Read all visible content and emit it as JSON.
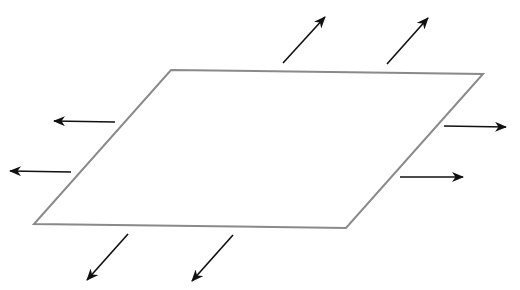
{
  "diagram": {
    "title": "",
    "colors": {
      "background": "#ffffff",
      "sheet_outline": "#8a8a8a",
      "arrow": "#111111"
    },
    "sheet": {
      "points": "171,70 483,74 346,228 34,224"
    },
    "arrows": [
      {
        "name": "arrow-top-1",
        "x1": 283,
        "y1": 63,
        "x2": 325,
        "y2": 17,
        "direction": "up-right"
      },
      {
        "name": "arrow-top-2",
        "x1": 387,
        "y1": 64,
        "x2": 428,
        "y2": 18,
        "direction": "up-right"
      },
      {
        "name": "arrow-left-1",
        "x1": 115,
        "y1": 122,
        "x2": 54,
        "y2": 121,
        "direction": "left"
      },
      {
        "name": "arrow-left-2",
        "x1": 71,
        "y1": 172,
        "x2": 10,
        "y2": 171,
        "direction": "left"
      },
      {
        "name": "arrow-right-1",
        "x1": 444,
        "y1": 126,
        "x2": 506,
        "y2": 127,
        "direction": "right"
      },
      {
        "name": "arrow-right-2",
        "x1": 400,
        "y1": 177,
        "x2": 463,
        "y2": 177,
        "direction": "right"
      },
      {
        "name": "arrow-bottom-1",
        "x1": 128,
        "y1": 234,
        "x2": 87,
        "y2": 280,
        "direction": "down-left"
      },
      {
        "name": "arrow-bottom-2",
        "x1": 233,
        "y1": 235,
        "x2": 192,
        "y2": 281,
        "direction": "down-left"
      }
    ]
  }
}
